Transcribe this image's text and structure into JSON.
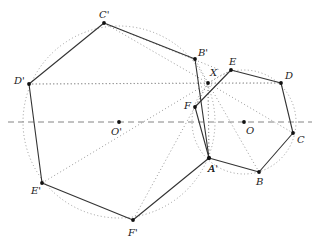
{
  "diagram": {
    "colors": {
      "background": "#ffffff",
      "solid_line": "#333333",
      "dotted_line": "#999999",
      "dashed_axis": "#777777",
      "point": "#111111"
    },
    "axis": {
      "x1": 8,
      "y1": 122,
      "x2": 312,
      "y2": 122
    },
    "big_circle": {
      "center_label": "O'",
      "cx": 119,
      "cy": 122,
      "r": 96
    },
    "small_circle": {
      "center_label": "O",
      "cx": 244,
      "cy": 122,
      "r": 52
    },
    "big_hexagon": {
      "vertices": [
        {
          "label": "A'",
          "x": 209,
          "y": 158,
          "lx": 208,
          "ly": 172
        },
        {
          "label": "B'",
          "x": 195,
          "y": 59,
          "lx": 198,
          "ly": 56
        },
        {
          "label": "C'",
          "x": 104,
          "y": 23,
          "lx": 99,
          "ly": 18
        },
        {
          "label": "D'",
          "x": 29,
          "y": 84,
          "lx": 14,
          "ly": 84
        },
        {
          "label": "E'",
          "x": 42,
          "y": 183,
          "lx": 31,
          "ly": 194
        },
        {
          "label": "F'",
          "x": 133,
          "y": 220,
          "lx": 128,
          "ly": 236
        }
      ]
    },
    "small_hexagon": {
      "vertices": [
        {
          "label": "A",
          "x": 209,
          "y": 158,
          "lx": 208,
          "ly": 172
        },
        {
          "label": "B",
          "x": 259,
          "y": 172,
          "lx": 256,
          "ly": 185
        },
        {
          "label": "C",
          "x": 293,
          "y": 133,
          "lx": 297,
          "ly": 143
        },
        {
          "label": "D",
          "x": 281,
          "y": 83,
          "lx": 285,
          "ly": 79
        },
        {
          "label": "E",
          "x": 231,
          "y": 70,
          "lx": 229,
          "ly": 65
        },
        {
          "label": "F",
          "x": 195,
          "y": 107,
          "lx": 184,
          "ly": 109
        }
      ]
    },
    "point_X": {
      "label": "X",
      "x": 208,
      "y": 83,
      "lx": 210,
      "ly": 76
    },
    "center_labels": [
      {
        "label": "O'",
        "x": 119,
        "y": 122,
        "lx": 111,
        "ly": 135
      },
      {
        "label": "O",
        "x": 244,
        "y": 122,
        "lx": 246,
        "ly": 134
      }
    ]
  }
}
